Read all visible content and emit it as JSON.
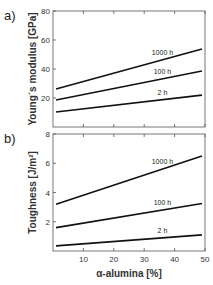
{
  "chart_data": [
    {
      "panel": "a)",
      "type": "line",
      "title": "",
      "xlabel": "",
      "ylabel": "Young´s modulus [GPa]",
      "xlim": [
        0,
        50
      ],
      "ylim": [
        0,
        80
      ],
      "yticks": [
        20,
        40,
        60,
        80
      ],
      "xticks": [
        10,
        20,
        30,
        40,
        50
      ],
      "grid": false,
      "series": [
        {
          "name": "1000 h",
          "x": [
            1,
            49
          ],
          "values": [
            26.2,
            53.8
          ]
        },
        {
          "name": "100 h",
          "x": [
            1,
            49
          ],
          "values": [
            18.6,
            38.6
          ]
        },
        {
          "name": "2 h",
          "x": [
            1,
            49
          ],
          "values": [
            10.3,
            22.0
          ]
        }
      ]
    },
    {
      "panel": "b)",
      "type": "line",
      "title": "",
      "xlabel": "α-alumina [%]",
      "ylabel": "Toughness [J/m²]",
      "xlim": [
        0,
        50
      ],
      "ylim": [
        0,
        8
      ],
      "yticks": [
        2,
        4,
        6,
        8
      ],
      "xticks": [
        10,
        20,
        30,
        40,
        50
      ],
      "grid": false,
      "series": [
        {
          "name": "1000 h",
          "x": [
            1,
            49
          ],
          "values": [
            3.2,
            6.5
          ]
        },
        {
          "name": "100 h",
          "x": [
            1,
            49
          ],
          "values": [
            1.6,
            3.25
          ]
        },
        {
          "name": "2 h",
          "x": [
            1,
            49
          ],
          "values": [
            0.35,
            1.1
          ]
        }
      ]
    }
  ]
}
